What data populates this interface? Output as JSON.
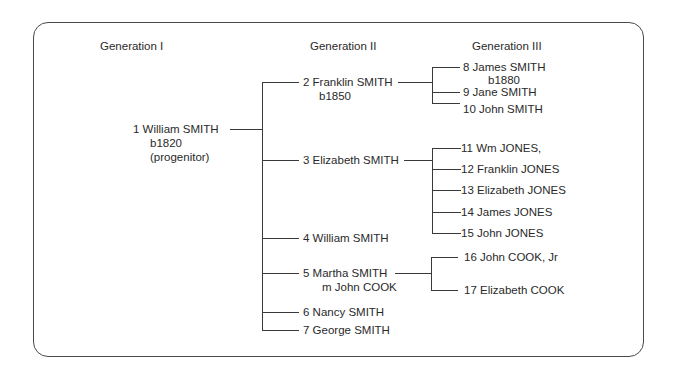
{
  "headers": [
    "Generation I",
    "Generation II",
    "Generation III"
  ],
  "gen1": [
    {
      "id": "1",
      "lines": [
        "1  William SMITH",
        "b1820",
        "(progenitor)"
      ]
    }
  ],
  "gen2": [
    {
      "id": "2",
      "lines": [
        "2 Franklin SMITH",
        "b1850"
      ]
    },
    {
      "id": "3",
      "lines": [
        "3  Elizabeth SMITH"
      ]
    },
    {
      "id": "4",
      "lines": [
        "4  William SMITH"
      ]
    },
    {
      "id": "5",
      "lines": [
        "5  Martha SMITH",
        "m John COOK"
      ]
    },
    {
      "id": "6",
      "lines": [
        "6 Nancy SMITH"
      ]
    },
    {
      "id": "7",
      "lines": [
        "7  George SMITH"
      ]
    }
  ],
  "gen3": [
    {
      "id": "8",
      "parent": "2",
      "lines": [
        "8 James SMITH",
        "b1880"
      ]
    },
    {
      "id": "9",
      "parent": "2",
      "lines": [
        "9  Jane SMITH"
      ]
    },
    {
      "id": "10",
      "parent": "2",
      "lines": [
        "10 John SMITH"
      ]
    },
    {
      "id": "11",
      "parent": "3",
      "lines": [
        "11 Wm JONES,"
      ]
    },
    {
      "id": "12",
      "parent": "3",
      "lines": [
        "12 Franklin JONES"
      ]
    },
    {
      "id": "13",
      "parent": "3",
      "lines": [
        "13 Elizabeth JONES"
      ]
    },
    {
      "id": "14",
      "parent": "3",
      "lines": [
        "14 James JONES"
      ]
    },
    {
      "id": "15",
      "parent": "3",
      "lines": [
        "15 John JONES"
      ]
    },
    {
      "id": "16",
      "parent": "5",
      "lines": [
        "16  John COOK, Jr"
      ]
    },
    {
      "id": "17",
      "parent": "5",
      "lines": [
        "17  Elizabeth COOK"
      ]
    }
  ]
}
